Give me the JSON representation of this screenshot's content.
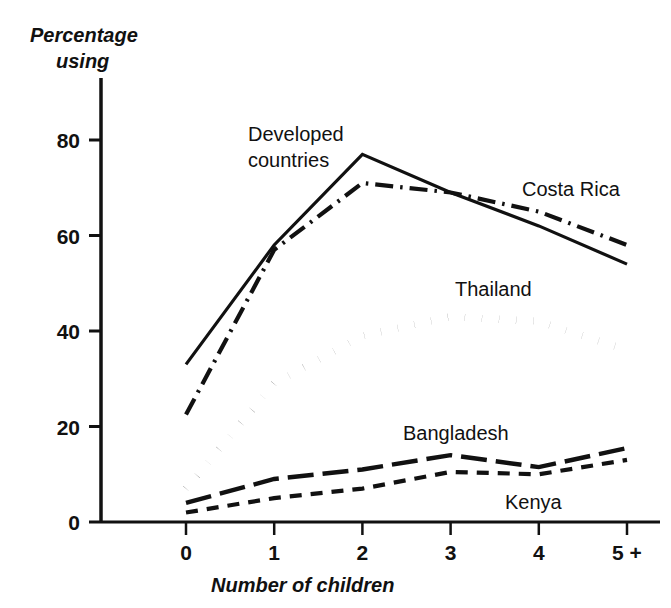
{
  "chart_data": {
    "type": "line",
    "title": "",
    "xlabel": "Number of children",
    "ylabel": "Percentage using",
    "ylabel_line1": "Percentage",
    "ylabel_line2": "using",
    "categories": [
      "0",
      "1",
      "2",
      "3",
      "4",
      "5 +"
    ],
    "xticks": [
      "0",
      "1",
      "2",
      "3",
      "4",
      "5 +"
    ],
    "yticks": [
      "0",
      "20",
      "40",
      "60",
      "80"
    ],
    "ytick_values": [
      0,
      20,
      40,
      60,
      80
    ],
    "xlim": [
      0,
      5
    ],
    "ylim": [
      0,
      90
    ],
    "grid": false,
    "legend": "inline-annotations",
    "series": [
      {
        "name": "Developed countries",
        "style": "solid",
        "label": "Developed countries",
        "label_line1": "Developed",
        "label_line2": "countries",
        "values": [
          33,
          58,
          77,
          69,
          62,
          54
        ]
      },
      {
        "name": "Costa Rica",
        "style": "dash-dot",
        "label": "Costa Rica",
        "values": [
          22.5,
          57,
          71,
          69,
          65,
          58
        ]
      },
      {
        "name": "Thailand",
        "style": "dotted",
        "label": "Thailand",
        "values": [
          7,
          29,
          39,
          43,
          42,
          36
        ]
      },
      {
        "name": "Bangladesh",
        "style": "long-dash",
        "label": "Bangladesh",
        "values": [
          4,
          9,
          11,
          14,
          11.5,
          15.5
        ]
      },
      {
        "name": "Kenya",
        "style": "short-dash",
        "label": "Kenya",
        "values": [
          2,
          5,
          7,
          10.5,
          10,
          13
        ]
      }
    ],
    "colors": {
      "axis": "#111111",
      "line": "#111111",
      "background": "#ffffff"
    }
  }
}
